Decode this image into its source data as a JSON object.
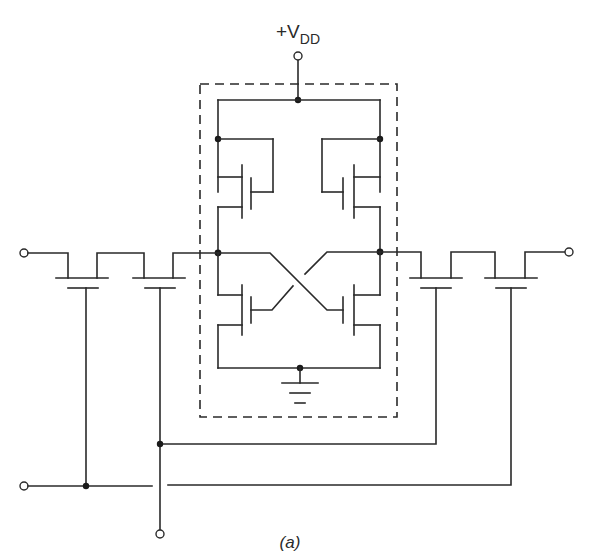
{
  "diagram": {
    "type": "circuit-schematic",
    "supply_label": {
      "main": "+V",
      "subscript": "DD"
    },
    "caption": "(a)",
    "colors": {
      "wire": "#2a2a2a",
      "background": "#ffffff",
      "junction": "#1a1a1a"
    },
    "components": [
      {
        "id": "p-left",
        "kind": "pmos",
        "location": "upper-left inside cell"
      },
      {
        "id": "p-right",
        "kind": "pmos",
        "location": "upper-right inside cell"
      },
      {
        "id": "n-left",
        "kind": "nmos",
        "location": "lower-left inside cell"
      },
      {
        "id": "n-right",
        "kind": "nmos",
        "location": "lower-right inside cell"
      },
      {
        "id": "access-left-1",
        "kind": "access-transistor",
        "location": "left bit line, outer"
      },
      {
        "id": "access-left-2",
        "kind": "access-transistor",
        "location": "left bit line, inner"
      },
      {
        "id": "access-right-1",
        "kind": "access-transistor",
        "location": "right bit line, inner"
      },
      {
        "id": "access-right-2",
        "kind": "access-transistor",
        "location": "right bit line, outer"
      },
      {
        "id": "ground",
        "kind": "ground-symbol",
        "location": "bottom centre of cell"
      }
    ],
    "terminals": [
      {
        "id": "vdd",
        "position": "top centre"
      },
      {
        "id": "bit-left",
        "position": "left"
      },
      {
        "id": "bit-right",
        "position": "right"
      },
      {
        "id": "word-line-a",
        "position": "bottom left"
      },
      {
        "id": "word-line-b",
        "position": "bottom centre"
      }
    ]
  }
}
